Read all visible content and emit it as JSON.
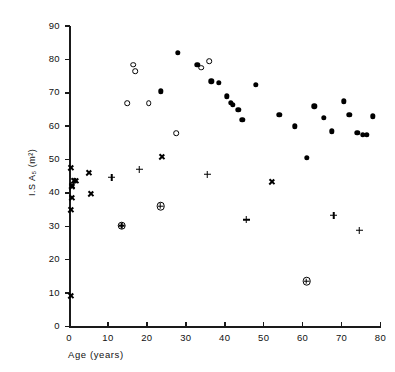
{
  "chart_data": {
    "type": "scatter",
    "title": "",
    "xlabel": "Age (years)",
    "ylabel": "I.S A₅ (m²)",
    "xlim": [
      0,
      80
    ],
    "ylim": [
      0,
      90
    ],
    "xticks": [
      0,
      10,
      20,
      30,
      40,
      50,
      60,
      70,
      80
    ],
    "yticks": [
      0,
      10,
      20,
      30,
      40,
      50,
      60,
      70,
      80,
      90
    ],
    "grid": false,
    "legend_position": "none",
    "series": [
      {
        "name": "x-marker",
        "marker": "x",
        "points": [
          [
            0.4,
            47.5
          ],
          [
            0.6,
            44.0
          ],
          [
            0.6,
            42.5
          ],
          [
            0.5,
            41.0
          ],
          [
            0.8,
            50.0
          ],
          [
            1.2,
            53.5
          ],
          [
            1.8,
            55.5
          ],
          [
            0.5,
            23.0
          ],
          [
            5.5,
            55.5
          ],
          [
            5.0,
            64.0
          ],
          [
            23.8,
            70.5
          ],
          [
            52.0,
            65.0
          ]
        ]
      },
      {
        "name": "open-circle",
        "marker": "o",
        "points": [
          [
            15.0,
            67.0
          ],
          [
            16.5,
            78.5
          ],
          [
            17.0,
            76.5
          ],
          [
            20.5,
            67.0
          ],
          [
            27.5,
            58.0
          ],
          [
            34.0,
            77.5
          ],
          [
            36.0,
            79.5
          ]
        ]
      },
      {
        "name": "plus-marker",
        "marker": "+",
        "points": [
          [
            11.0,
            68.5
          ],
          [
            18.0,
            73.0
          ],
          [
            35.5,
            73.5
          ],
          [
            45.5,
            62.0
          ],
          [
            68.0,
            65.5
          ],
          [
            74.5,
            63.0
          ]
        ]
      },
      {
        "name": "crossed-circle",
        "marker": "crossed-circle",
        "points": [
          [
            13.5,
            66.5
          ],
          [
            23.5,
            75.0
          ],
          [
            61.0,
            55.0
          ]
        ]
      },
      {
        "name": "filled-circle",
        "marker": "filled",
        "points": [
          [
            23.5,
            70.5
          ],
          [
            28.0,
            82.0
          ],
          [
            33.0,
            78.5
          ],
          [
            36.5,
            73.5
          ],
          [
            38.5,
            73.0
          ],
          [
            40.5,
            69.0
          ],
          [
            41.5,
            67.0
          ],
          [
            42.0,
            66.5
          ],
          [
            43.5,
            65.0
          ],
          [
            44.5,
            62.0
          ],
          [
            48.0,
            72.5
          ],
          [
            54.0,
            63.5
          ],
          [
            58.0,
            60.0
          ],
          [
            61.0,
            50.5
          ],
          [
            63.0,
            66.0
          ],
          [
            65.5,
            62.5
          ],
          [
            67.5,
            58.5
          ],
          [
            70.5,
            67.5
          ],
          [
            72.0,
            63.5
          ],
          [
            74.0,
            58.0
          ],
          [
            75.5,
            57.5
          ],
          [
            76.5,
            57.5
          ],
          [
            78.0,
            63.0
          ]
        ]
      }
    ]
  },
  "axes": {
    "x_tick_labels": [
      "0",
      "10",
      "20",
      "30",
      "40",
      "50",
      "60",
      "70",
      "80"
    ],
    "y_tick_labels": [
      "0",
      "10",
      "20",
      "30",
      "40",
      "50",
      "60",
      "70",
      "80",
      "90"
    ],
    "x_axis_title": "Age (years)",
    "y_axis_title": "I.S A₅ (m²)"
  },
  "colors": {
    "ink": "#000000",
    "background": "#ffffff"
  }
}
